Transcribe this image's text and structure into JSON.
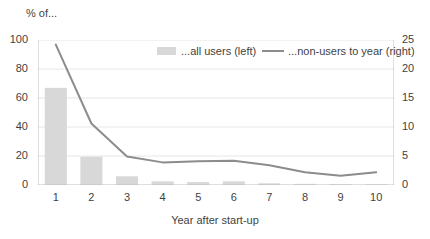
{
  "chart_data": {
    "type": "bar",
    "title": "% of...",
    "xlabel": "Year after start-up",
    "ylabel": "",
    "categories": [
      "1",
      "2",
      "3",
      "4",
      "5",
      "6",
      "7",
      "8",
      "9",
      "10"
    ],
    "x": [
      1,
      2,
      3,
      4,
      5,
      6,
      7,
      8,
      9,
      10
    ],
    "grid": true,
    "legend_position": "top",
    "left_axis": {
      "ylim": [
        0,
        100
      ],
      "ticks": [
        "0",
        "20",
        "40",
        "60",
        "80",
        "100"
      ],
      "tick_values": [
        0,
        20,
        40,
        60,
        80,
        100
      ]
    },
    "right_axis": {
      "ylim": [
        0,
        25
      ],
      "ticks": [
        "0",
        "5",
        "10",
        "15",
        "20",
        "25"
      ],
      "tick_values": [
        0,
        5,
        10,
        15,
        20,
        25
      ]
    },
    "series": [
      {
        "name": "...all users (left)",
        "type": "bar",
        "axis": "left",
        "color": "#d8d8d8",
        "values": [
          67,
          19.5,
          6,
          2.5,
          2,
          2.5,
          1.2,
          0.8,
          0.6,
          0.5
        ]
      },
      {
        "name": "...non-users to year (right)",
        "type": "line",
        "axis": "right",
        "color": "#8c8c8c",
        "values": [
          24.2,
          10.6,
          4.9,
          3.9,
          4.1,
          4.2,
          3.4,
          2.2,
          1.6,
          2.2
        ]
      }
    ]
  },
  "legend": {
    "bars_label": "...all users (left)",
    "line_label": "...non-users to year (right)"
  }
}
